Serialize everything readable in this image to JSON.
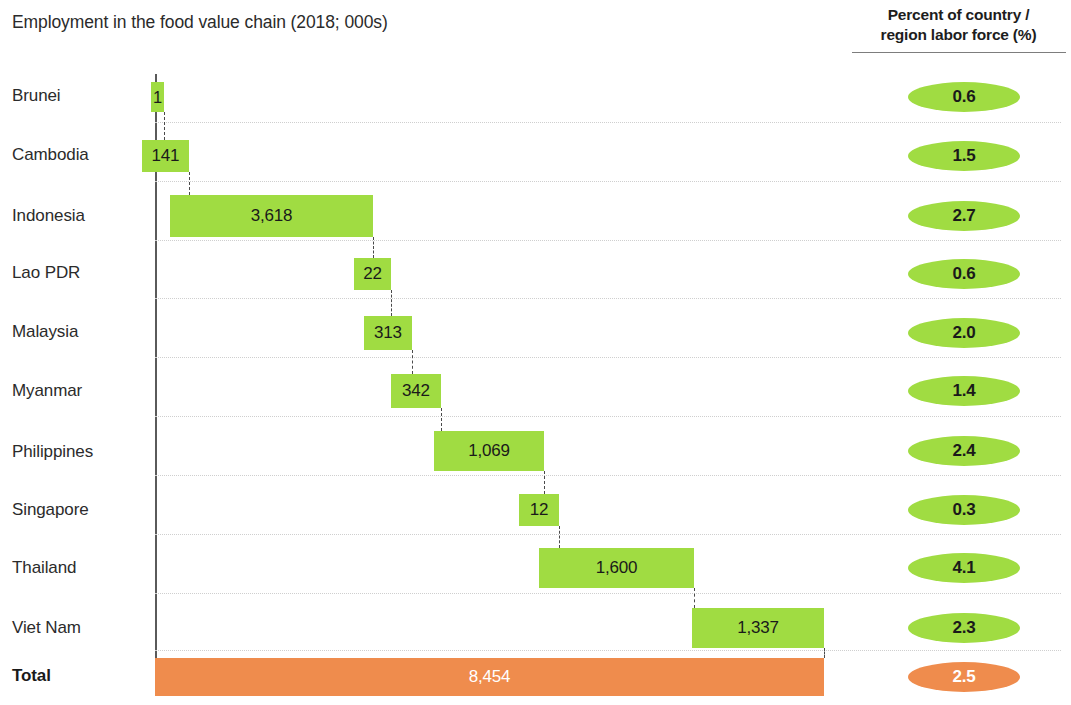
{
  "chart_data": {
    "type": "bar",
    "subtype": "waterfall",
    "title": "Employment in the food value chain (2018; 000s)",
    "xlabel": "",
    "ylabel": "",
    "unit": "thousands of workers",
    "grid": true,
    "legend": "none",
    "categories": [
      "Brunei",
      "Cambodia",
      "Indonesia",
      "Lao PDR",
      "Malaysia",
      "Myanmar",
      "Philippines",
      "Singapore",
      "Thailand",
      "Viet Nam",
      "Total"
    ],
    "values": [
      1,
      141,
      3618,
      22,
      313,
      342,
      1069,
      12,
      1600,
      1337,
      8454
    ],
    "value_labels": [
      "1",
      "141",
      "3,618",
      "22",
      "313",
      "342",
      "1,069",
      "12",
      "1,600",
      "1,337",
      "8,454"
    ],
    "cumulative": [
      1,
      142,
      3760,
      3782,
      4095,
      4437,
      5506,
      5518,
      7118,
      8455,
      8454
    ],
    "series": [
      {
        "name": "Employment in the food value chain (2018; 000s)",
        "values": [
          1,
          141,
          3618,
          22,
          313,
          342,
          1069,
          12,
          1600,
          1337,
          8454
        ]
      },
      {
        "name": "Percent of country / region labor force (%)",
        "values": [
          0.6,
          1.5,
          2.7,
          0.6,
          2.0,
          1.4,
          2.4,
          0.3,
          4.1,
          2.3,
          2.5
        ]
      }
    ],
    "percent_labels": [
      "0.6",
      "1.5",
      "2.7",
      "0.6",
      "2.0",
      "1.4",
      "2.4",
      "0.3",
      "4.1",
      "2.3",
      "2.5"
    ],
    "percent_header_line1": "Percent of country /",
    "percent_header_line2": "region labor force (%)",
    "xlim": [
      0,
      8454
    ],
    "colors": {
      "bar_green": "#a0dc42",
      "total_orange": "#ef8c4d",
      "text": "#2b2b2b",
      "total_text": "#ffffff",
      "gridline": "#cfcfcf",
      "axis": "#5a5a5a"
    }
  },
  "rows": [
    {
      "label": "Brunei",
      "value": "1",
      "percent": "0.6",
      "is_total": false
    },
    {
      "label": "Cambodia",
      "value": "141",
      "percent": "1.5",
      "is_total": false
    },
    {
      "label": "Indonesia",
      "value": "3,618",
      "percent": "2.7",
      "is_total": false
    },
    {
      "label": "Lao PDR",
      "value": "22",
      "percent": "0.6",
      "is_total": false
    },
    {
      "label": "Malaysia",
      "value": "313",
      "percent": "2.0",
      "is_total": false
    },
    {
      "label": "Myanmar",
      "value": "342",
      "percent": "1.4",
      "is_total": false
    },
    {
      "label": "Philippines",
      "value": "1,069",
      "percent": "2.4",
      "is_total": false
    },
    {
      "label": "Singapore",
      "value": "12",
      "percent": "0.3",
      "is_total": false
    },
    {
      "label": "Thailand",
      "value": "1,600",
      "percent": "4.1",
      "is_total": false
    },
    {
      "label": "Viet Nam",
      "value": "1,337",
      "percent": "2.3",
      "is_total": false
    },
    {
      "label": "Total",
      "value": "8,454",
      "percent": "2.5",
      "is_total": true
    }
  ],
  "header": {
    "chart_title": "Employment in the food value chain (2018; 000s)",
    "percent_line1": "Percent of country /",
    "percent_line2": "region labor force (%)"
  }
}
